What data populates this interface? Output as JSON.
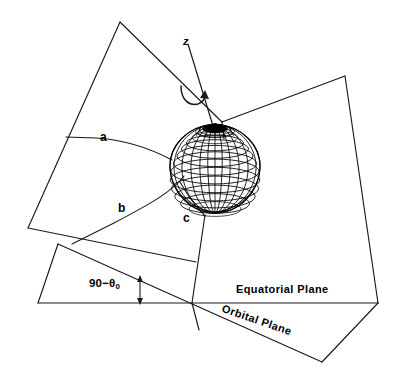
{
  "figure": {
    "type": "technical-line-diagram",
    "background_color": "#ffffff",
    "line_color": "#1a1a1a",
    "canvas": {
      "width": 397,
      "height": 385
    }
  },
  "labels": {
    "axis_z": "z",
    "ray_a": "a",
    "ray_b": "b",
    "ray_c": "c",
    "angle": "90−θ",
    "angle_subscript": "0",
    "equatorial_plane": "Equatorial  Plane",
    "orbital_plane": "Orbital  Plane"
  },
  "annotations": {
    "rotation_arrow": "curved-rotation-arrow-about-z-axis",
    "angle_marker": "vertical-double-headed-arrow",
    "angle_value_text": "90−θ₀"
  },
  "geometry": {
    "globe": {
      "name": "wireframe-globe",
      "center_x": 215,
      "center_y": 168,
      "radius_x": 45,
      "radius_y": 45,
      "pole_top_y": 123,
      "bottom_y": 213,
      "latitude_count": 12,
      "longitude_count": 24,
      "pole_cap_filled": true
    },
    "planes": [
      {
        "name": "upper-left-plane",
        "vertices": [
          [
            120,
            22
          ],
          [
            28,
            228
          ],
          [
            196,
            262
          ],
          [
            222,
            122
          ]
        ]
      },
      {
        "name": "right-plane",
        "vertices": [
          [
            222,
            122
          ],
          [
            345,
            76
          ],
          [
            378,
            303
          ],
          [
            192,
            303
          ]
        ]
      },
      {
        "name": "equatorial-plane-trace",
        "vertices": [
          [
            38,
            303
          ],
          [
            378,
            303
          ]
        ]
      },
      {
        "name": "orbital-plane",
        "vertices": [
          [
            58,
            244
          ],
          [
            322,
            362
          ],
          [
            378,
            303
          ]
        ]
      }
    ],
    "z_axis": {
      "from": [
        188,
        44
      ],
      "to": [
        213,
        126
      ]
    },
    "angle_marker": {
      "x": 140,
      "y_top": 277,
      "y_bottom": 303
    }
  }
}
